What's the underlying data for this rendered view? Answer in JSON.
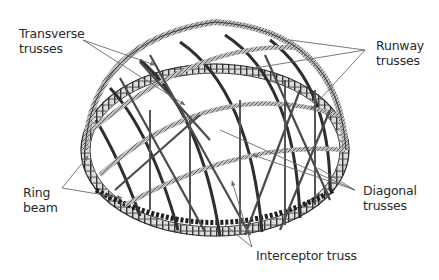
{
  "diagram": {
    "type": "structural-illustration",
    "colors": {
      "background": "#ffffff",
      "truss": "#555555",
      "truss_dark": "#2e2e2e",
      "leader_line": "#6a6a6a",
      "text": "#2a2a2a"
    },
    "labels": [
      {
        "id": "transverse",
        "line1": "Transverse",
        "line2": "trusses"
      },
      {
        "id": "runway",
        "line1": "Runway",
        "line2": "trusses"
      },
      {
        "id": "ring",
        "line1": "Ring",
        "line2": "beam"
      },
      {
        "id": "diagonal",
        "line1": "Diagonal",
        "line2": "trusses"
      },
      {
        "id": "interceptor",
        "line1": "Interceptor truss"
      }
    ]
  }
}
